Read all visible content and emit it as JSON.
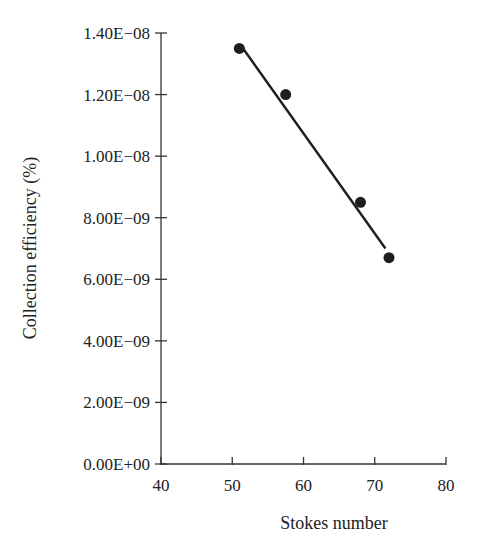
{
  "chart_data": {
    "type": "scatter",
    "title": "",
    "xlabel": "Stokes number",
    "ylabel": "Collection efficiency (%)",
    "xlim": [
      40,
      80
    ],
    "ylim": [
      0,
      1.4e-08
    ],
    "x_ticks": [
      40,
      50,
      60,
      70,
      80
    ],
    "x_tick_labels": [
      "40",
      "50",
      "60",
      "70",
      "80"
    ],
    "y_ticks": [
      0,
      2e-09,
      4e-09,
      6e-09,
      8e-09,
      1e-08,
      1.2e-08,
      1.4e-08
    ],
    "y_tick_labels": [
      "0.00E+00",
      "2.00E−09",
      "4.00E−09",
      "6.00E−09",
      "8.00E−09",
      "1.00E−08",
      "1.20E−08",
      "1.40E−08"
    ],
    "grid": false,
    "legend": null,
    "series": [
      {
        "name": "Measured",
        "marker": "filled-circle",
        "color": "#1e1e1e",
        "x": [
          51,
          57.5,
          68,
          72
        ],
        "y": [
          1.35e-08,
          1.2e-08,
          8.5e-09,
          6.7e-09
        ]
      }
    ],
    "trendline": {
      "type": "linear",
      "color": "#1e1e1e",
      "x": [
        51.2,
        71.5
      ],
      "y": [
        1.36e-08,
        7e-09
      ]
    }
  },
  "colors": {
    "axis": "#333333",
    "text": "#222222",
    "marker": "#1e1e1e",
    "background": "#ffffff"
  }
}
